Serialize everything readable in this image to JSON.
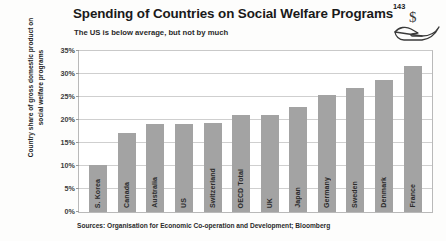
{
  "header": {
    "title": "Spending of Countries on Social Welfare Programs",
    "title_superscript": "143",
    "subtitle": "The US is below average, but not by much",
    "icon": "hand-holding-dollar-icon"
  },
  "source_note": "Sources: Organisation for Economic Co-operation and Development; Bloomberg",
  "colors": {
    "bar": "#a3a3a3",
    "gridline": "#cfcfcf",
    "text": "#231f20",
    "plot_background": "#ffffff"
  },
  "chart_data": {
    "type": "bar",
    "title": "Spending of Countries on Social Welfare Programs",
    "subtitle": "The US is below average, but not by much",
    "xlabel": "",
    "ylabel": "Country share of gross domestic product on social welfare programs",
    "ylim": [
      0,
      35
    ],
    "yticks": [
      0,
      5,
      10,
      15,
      20,
      25,
      30,
      35
    ],
    "ytick_labels": [
      "0%",
      "5%",
      "10%",
      "15%",
      "20%",
      "25%",
      "30%",
      "35%"
    ],
    "grid": true,
    "legend": "none",
    "categories": [
      "S. Korea",
      "Canada",
      "Australia",
      "US",
      "Switzerland",
      "OECD Total",
      "UK",
      "Japan",
      "Germany",
      "Sweden",
      "Denmark",
      "France"
    ],
    "values": [
      10.2,
      17.2,
      19.2,
      19.2,
      19.4,
      21.0,
      21.0,
      22.8,
      25.4,
      26.9,
      28.8,
      31.8
    ]
  }
}
